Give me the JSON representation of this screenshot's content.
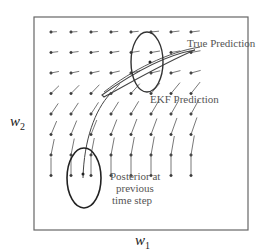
{
  "labels": {
    "true_prediction": "True Prediction",
    "ekf_prediction": "EKF Prediction",
    "posterior_line1": "Posterior at",
    "posterior_line2": "previous",
    "posterior_line3": "time step"
  },
  "axes": {
    "x": {
      "var": "w",
      "sub": "1"
    },
    "y": {
      "var": "w",
      "sub": "2"
    }
  },
  "grid": {
    "cols": 8,
    "rows": 8
  },
  "colors": {
    "frame": "#666666",
    "arrow": "#555555",
    "ellipse": "#333333",
    "text": "#555555"
  }
}
